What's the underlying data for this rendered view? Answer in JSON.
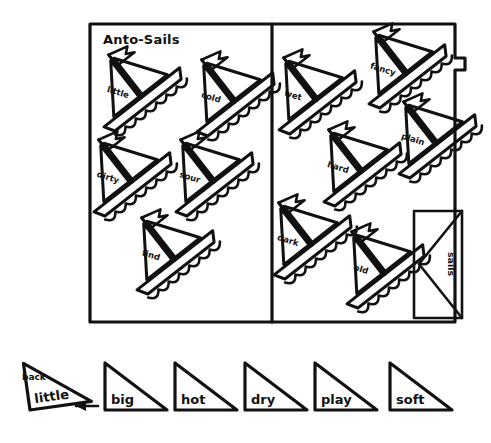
{
  "page": {
    "title": "Anto-Sails",
    "background_color": "#ffffff",
    "ink_color": "#111111"
  },
  "board": {
    "name": "anto-sails-board",
    "left_panel": {
      "label": "left-panel",
      "boats": [
        {
          "word": "little",
          "x": 135,
          "y": 95,
          "rot": -38,
          "flag_dir": "right"
        },
        {
          "word": "cold",
          "x": 228,
          "y": 100,
          "rot": -38,
          "flag_dir": "right"
        },
        {
          "word": "dirty",
          "x": 125,
          "y": 180,
          "rot": -38,
          "flag_dir": "right"
        },
        {
          "word": "sour",
          "x": 207,
          "y": 180,
          "rot": -38,
          "flag_dir": "right"
        },
        {
          "word": "find",
          "x": 168,
          "y": 258,
          "rot": -38,
          "flag_dir": "right"
        }
      ]
    },
    "right_panel": {
      "label": "right-panel",
      "boats": [
        {
          "word": "wet",
          "x": 310,
          "y": 98,
          "rot": -38,
          "flag_dir": "right"
        },
        {
          "word": "fancy",
          "x": 400,
          "y": 72,
          "rot": -38,
          "flag_dir": "right"
        },
        {
          "word": "hard",
          "x": 355,
          "y": 170,
          "rot": -38,
          "flag_dir": "right"
        },
        {
          "word": "plain",
          "x": 430,
          "y": 142,
          "rot": -38,
          "flag_dir": "right"
        },
        {
          "word": "dark",
          "x": 305,
          "y": 243,
          "rot": -38,
          "flag_dir": "right"
        },
        {
          "word": "old",
          "x": 378,
          "y": 272,
          "rot": -38,
          "flag_dir": "right"
        }
      ]
    },
    "side_tab": {
      "label": "sails",
      "name": "sails-tab"
    }
  },
  "tray": {
    "name": "word-sail-tray",
    "back_label": "back",
    "arrow": "left-arrow",
    "tiles": [
      {
        "word": "little",
        "selected": true
      },
      {
        "word": "big",
        "selected": false
      },
      {
        "word": "hot",
        "selected": false
      },
      {
        "word": "dry",
        "selected": false
      },
      {
        "word": "play",
        "selected": false
      },
      {
        "word": "soft",
        "selected": false
      }
    ]
  }
}
